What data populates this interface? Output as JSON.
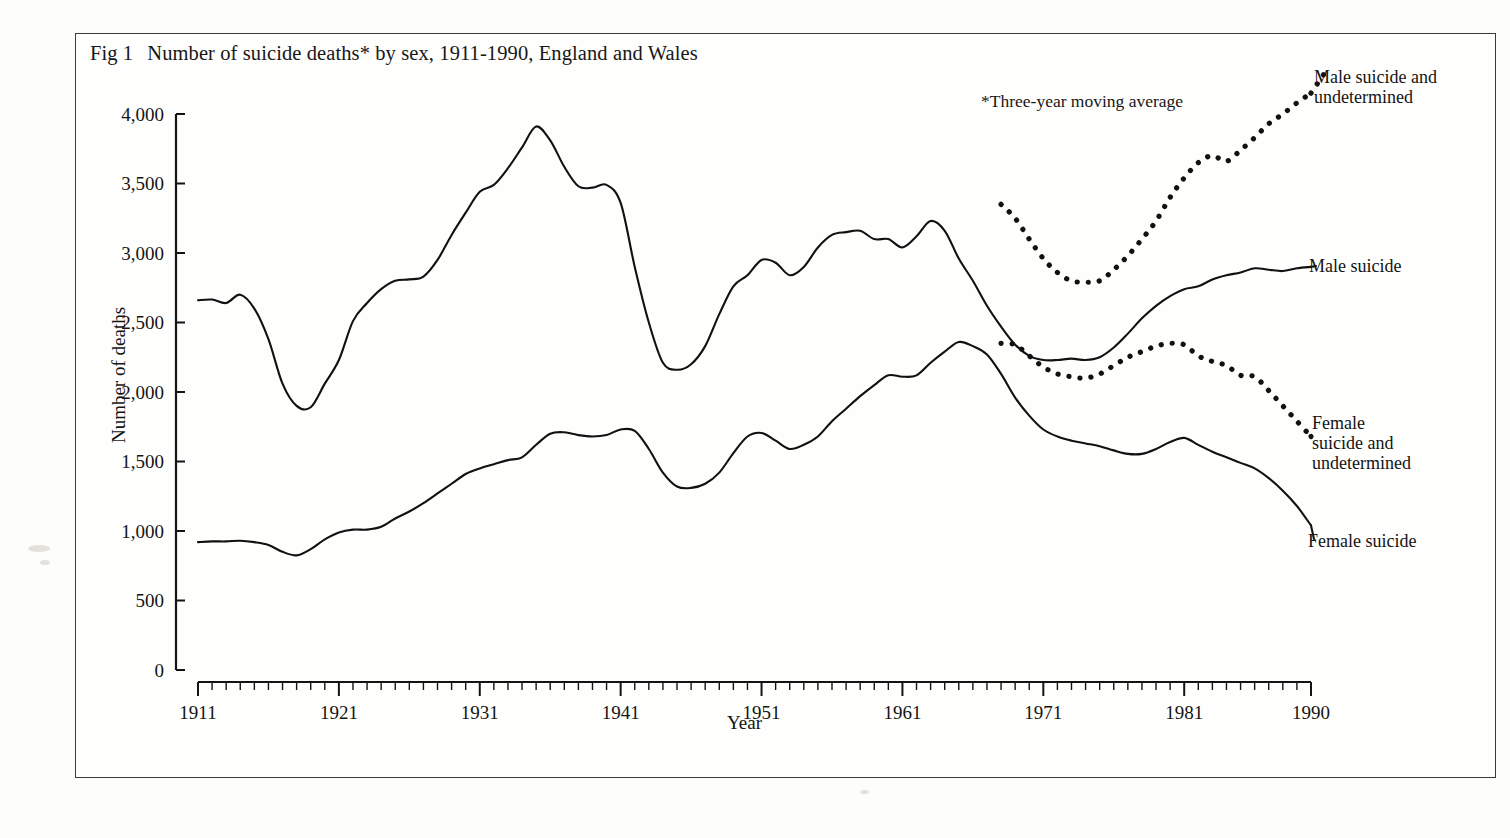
{
  "figure": {
    "fig_number": "Fig 1",
    "title": "Number of suicide deaths* by sex, 1911-1990, England and Wales",
    "footnote": "*Three-year moving average",
    "xlabel": "Year",
    "ylabel": "Number of deaths",
    "labels": {
      "male_undetermined_line1": "Male suicide and",
      "male_undetermined_line2": "undetermined",
      "male": "Male suicide",
      "female_undetermined_line1": "Female",
      "female_undetermined_line2": "suicide and",
      "female_undetermined_line3": "undetermined",
      "female": "Female suicide"
    }
  },
  "chart_data": {
    "type": "line",
    "subtitle": "*Three-year moving average",
    "xlabel": "Year",
    "ylabel": "Number of deaths",
    "xlim": [
      1911,
      1990
    ],
    "ylim": [
      0,
      4000
    ],
    "ytick_labels": [
      "0",
      "500",
      "1,000",
      "1,500",
      "2,000",
      "2,500",
      "3,000",
      "3,500",
      "4,000"
    ],
    "yticks": [
      0,
      500,
      1000,
      1500,
      2000,
      2500,
      3000,
      3500,
      4000
    ],
    "xtick_labels": [
      "1911",
      "1921",
      "1931",
      "1941",
      "1951",
      "1961",
      "1971",
      "1981",
      "1990"
    ],
    "xticks": [
      1911,
      1921,
      1931,
      1941,
      1951,
      1961,
      1971,
      1981,
      1990
    ],
    "minor_xtick_interval": 1,
    "grid": false,
    "legend_position": "inline-right-of-curves",
    "series": [
      {
        "name": "Male suicide",
        "style": "solid",
        "color": "#111111",
        "x": [
          1911,
          1912,
          1913,
          1914,
          1915,
          1916,
          1917,
          1918,
          1919,
          1920,
          1921,
          1922,
          1923,
          1924,
          1925,
          1926,
          1927,
          1928,
          1929,
          1930,
          1931,
          1932,
          1933,
          1934,
          1935,
          1936,
          1937,
          1938,
          1939,
          1940,
          1941,
          1942,
          1943,
          1944,
          1945,
          1946,
          1947,
          1948,
          1949,
          1950,
          1951,
          1952,
          1953,
          1954,
          1955,
          1956,
          1957,
          1958,
          1959,
          1960,
          1961,
          1962,
          1963,
          1964,
          1965,
          1966,
          1967,
          1968,
          1969,
          1970,
          1971,
          1972,
          1973,
          1974,
          1975,
          1976,
          1977,
          1978,
          1979,
          1980,
          1981,
          1982,
          1983,
          1984,
          1985,
          1986,
          1987,
          1988,
          1989,
          1990
        ],
        "values": [
          2660,
          2665,
          2640,
          2700,
          2600,
          2380,
          2060,
          1900,
          1890,
          2060,
          2230,
          2510,
          2640,
          2740,
          2800,
          2810,
          2830,
          2950,
          3130,
          3290,
          3440,
          3490,
          3610,
          3760,
          3910,
          3810,
          3620,
          3480,
          3470,
          3490,
          3360,
          2900,
          2500,
          2210,
          2160,
          2200,
          2330,
          2560,
          2760,
          2840,
          2950,
          2930,
          2840,
          2900,
          3040,
          3130,
          3150,
          3160,
          3100,
          3100,
          3040,
          3120,
          3230,
          3160,
          2960,
          2800,
          2620,
          2470,
          2340,
          2260,
          2230,
          2230,
          2240,
          2230,
          2250,
          2320,
          2420,
          2530,
          2620,
          2690,
          2740,
          2760,
          2810,
          2840,
          2860,
          2890,
          2880,
          2870,
          2890,
          2900
        ]
      },
      {
        "name": "Female suicide",
        "style": "solid",
        "color": "#111111",
        "x": [
          1911,
          1912,
          1913,
          1914,
          1915,
          1916,
          1917,
          1918,
          1919,
          1920,
          1921,
          1922,
          1923,
          1924,
          1925,
          1926,
          1927,
          1928,
          1929,
          1930,
          1931,
          1932,
          1933,
          1934,
          1935,
          1936,
          1937,
          1938,
          1939,
          1940,
          1941,
          1942,
          1943,
          1944,
          1945,
          1946,
          1947,
          1948,
          1949,
          1950,
          1951,
          1952,
          1953,
          1954,
          1955,
          1956,
          1957,
          1958,
          1959,
          1960,
          1961,
          1962,
          1963,
          1964,
          1965,
          1966,
          1967,
          1968,
          1969,
          1970,
          1971,
          1972,
          1973,
          1974,
          1975,
          1976,
          1977,
          1978,
          1979,
          1980,
          1981,
          1982,
          1983,
          1984,
          1985,
          1986,
          1987,
          1988,
          1989,
          1990
        ],
        "values": [
          920,
          925,
          925,
          930,
          920,
          900,
          850,
          825,
          870,
          940,
          990,
          1010,
          1010,
          1030,
          1090,
          1140,
          1200,
          1270,
          1340,
          1410,
          1450,
          1480,
          1510,
          1530,
          1620,
          1700,
          1710,
          1690,
          1680,
          1690,
          1730,
          1720,
          1590,
          1420,
          1320,
          1310,
          1340,
          1420,
          1560,
          1680,
          1705,
          1650,
          1590,
          1620,
          1680,
          1790,
          1880,
          1970,
          2050,
          2120,
          2110,
          2120,
          2210,
          2290,
          2360,
          2330,
          2270,
          2130,
          1960,
          1830,
          1730,
          1680,
          1650,
          1630,
          1610,
          1580,
          1555,
          1555,
          1590,
          1640,
          1670,
          1620,
          1570,
          1530,
          1490,
          1450,
          1380,
          1290,
          1180,
          1040
        ]
      },
      {
        "name": "Male suicide and undetermined",
        "style": "dotted",
        "color": "#111111",
        "x": [
          1968,
          1969,
          1970,
          1971,
          1972,
          1973,
          1974,
          1975,
          1976,
          1977,
          1978,
          1979,
          1980,
          1981,
          1982,
          1983,
          1984,
          1985,
          1986,
          1987,
          1988,
          1989,
          1990
        ],
        "values": [
          3350,
          3250,
          3100,
          2960,
          2860,
          2800,
          2790,
          2800,
          2880,
          2980,
          3100,
          3230,
          3400,
          3540,
          3650,
          3700,
          3660,
          3740,
          3830,
          3930,
          4000,
          4080,
          4150
        ]
      },
      {
        "name": "Female suicide and undetermined",
        "style": "dotted",
        "color": "#111111",
        "x": [
          1968,
          1969,
          1970,
          1971,
          1972,
          1973,
          1974,
          1975,
          1976,
          1977,
          1978,
          1979,
          1980,
          1981,
          1982,
          1983,
          1984,
          1985,
          1986,
          1987,
          1988,
          1989,
          1990
        ],
        "values": [
          2350,
          2340,
          2260,
          2180,
          2130,
          2110,
          2100,
          2130,
          2190,
          2250,
          2290,
          2330,
          2350,
          2340,
          2260,
          2220,
          2190,
          2120,
          2110,
          2010,
          1900,
          1790,
          1680
        ]
      }
    ]
  }
}
